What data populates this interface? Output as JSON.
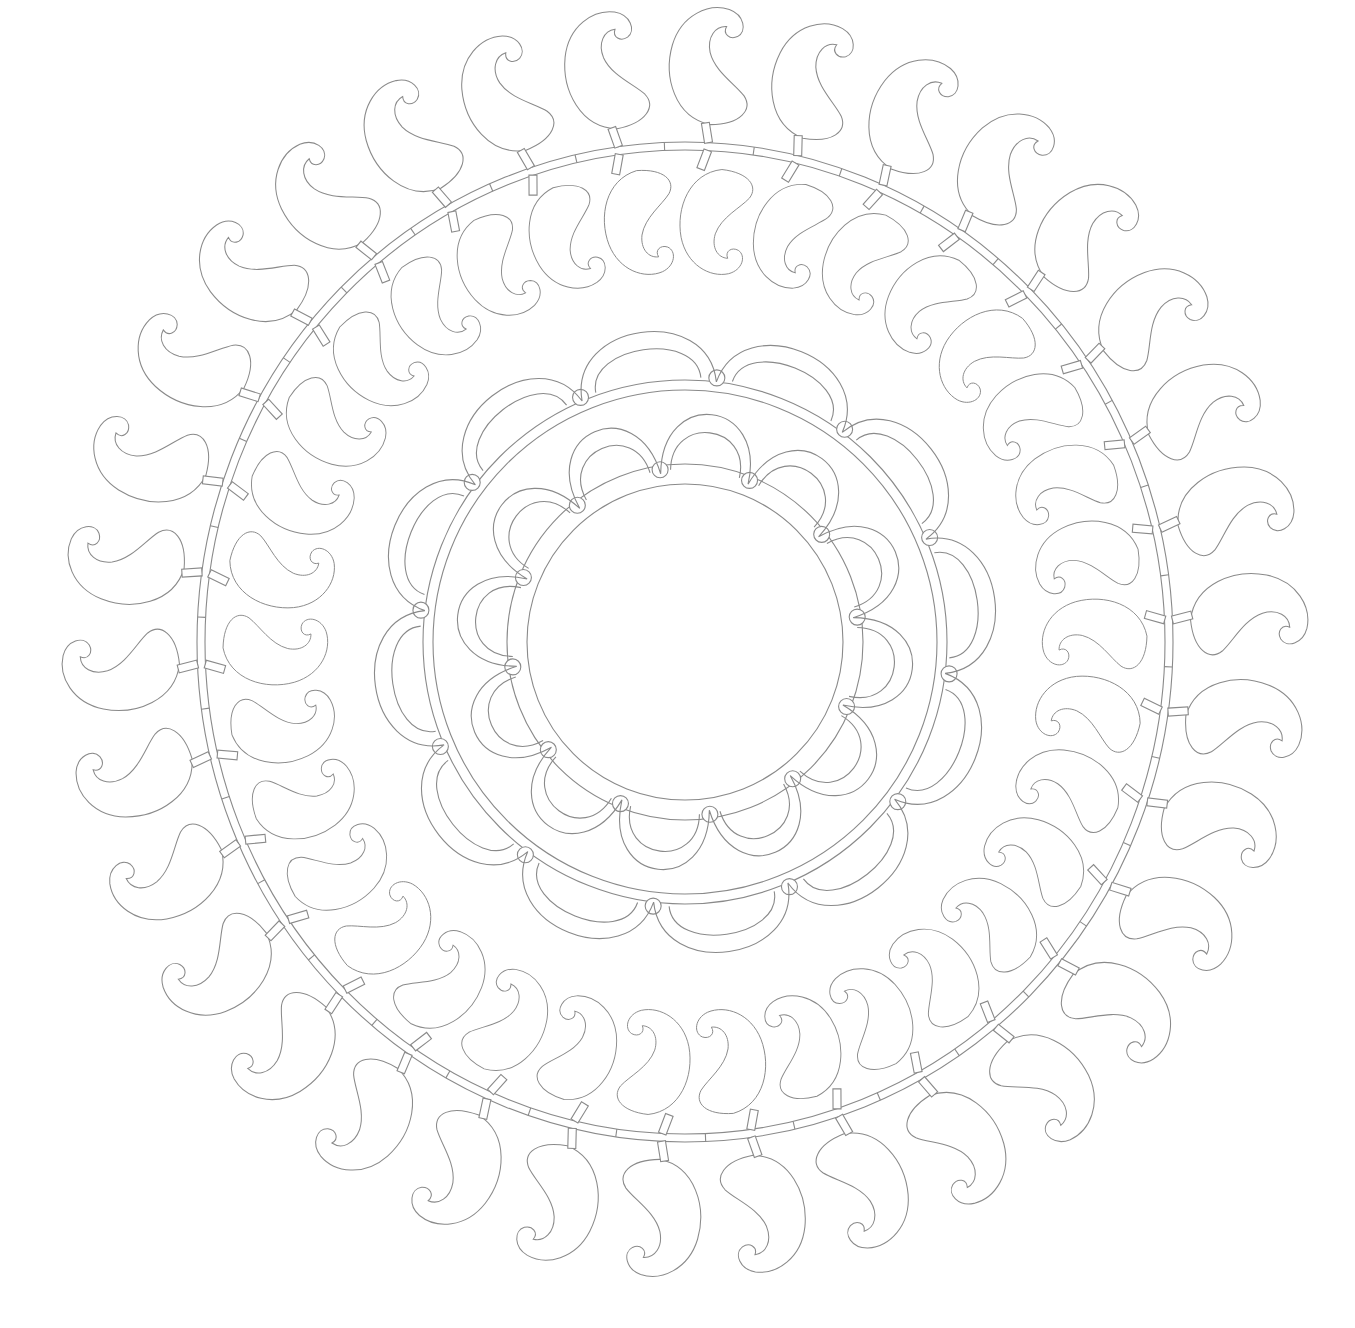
{
  "artwork": {
    "title": "Paisley mandala coloring page",
    "stroke_color": "#8a8a8a",
    "background": "#ffffff",
    "center": [
      685,
      642
    ],
    "outer_ring": {
      "band_radius_x": 484,
      "band_radius_y": 496,
      "band_width": 8,
      "connector_count": 34,
      "paisley_outward_count": 34,
      "paisley_inward_count": 34
    },
    "scallop_ring_outer": {
      "count": 12,
      "inner_radius": 262,
      "outer_radius": 322
    },
    "scallop_ring_inner": {
      "count": 12,
      "inner_radius": 170,
      "outer_radius": 238
    },
    "inner_circle_radius": 158
  }
}
